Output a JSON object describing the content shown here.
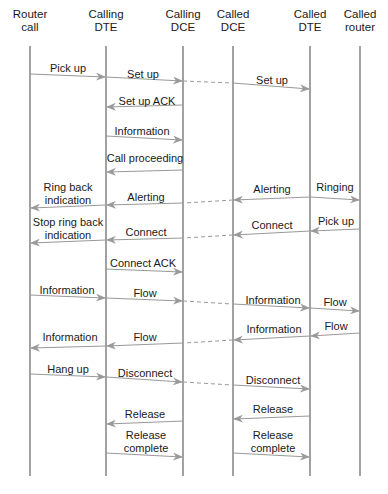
{
  "diagram": {
    "type": "sequence",
    "lifelines": [
      {
        "id": "router_call",
        "label": "Router\ncall",
        "line1": "Router",
        "line2": "call",
        "x": 30
      },
      {
        "id": "calling_dte",
        "label": "Calling\nDTE",
        "line1": "Calling",
        "line2": "DTE",
        "x": 106
      },
      {
        "id": "calling_dce",
        "label": "Calling\nDCE",
        "line1": "Calling",
        "line2": "DCE",
        "x": 183
      },
      {
        "id": "called_dce",
        "label": "Called\nDCE",
        "line1": "Called",
        "line2": "DCE",
        "x": 233
      },
      {
        "id": "called_dte",
        "label": "Called\nDTE",
        "line1": "Called",
        "line2": "DTE",
        "x": 310
      },
      {
        "id": "called_router",
        "label": "Called\nrouter",
        "line1": "Called",
        "line2": "router",
        "x": 360
      }
    ],
    "lifeline_top": 46,
    "lifeline_bottom": 476,
    "colors": {
      "line": "#555555",
      "arrow": "#999999",
      "text": "#1a1a1a"
    },
    "messages": [
      {
        "label": "Pick up",
        "from": 0,
        "to": 1,
        "y1": 74,
        "y2": 77,
        "lx": 68,
        "ly": 62
      },
      {
        "label": "Set up",
        "from": 1,
        "to": 2,
        "y1": 77,
        "y2": 81,
        "lx": 143,
        "ly": 68
      },
      {
        "label": "",
        "from": 2,
        "to": 3,
        "y1": 81,
        "y2": 83,
        "dashed": true
      },
      {
        "label": "Set up",
        "from": 3,
        "to": 4,
        "y1": 83,
        "y2": 89,
        "lx": 272,
        "ly": 74
      },
      {
        "label": "Set up ACK",
        "from": 2,
        "to": 1,
        "y1": 105,
        "y2": 107,
        "lx": 147,
        "ly": 95
      },
      {
        "label": "Information",
        "from": 1,
        "to": 2,
        "y1": 136,
        "y2": 140,
        "lx": 142,
        "ly": 125
      },
      {
        "label": "Call proceeding",
        "from": 2,
        "to": 1,
        "y1": 170,
        "y2": 172,
        "lx": 145,
        "ly": 152
      },
      {
        "label": "Ring back\nindication",
        "lines": [
          "Ring back",
          "indication"
        ],
        "from": 1,
        "to": 0,
        "y1": 205,
        "y2": 208,
        "lx": 68,
        "ly": 181
      },
      {
        "label": "Alerting",
        "from": 2,
        "to": 1,
        "y1": 203,
        "y2": 205,
        "lx": 146,
        "ly": 191
      },
      {
        "label": "",
        "from": 3,
        "to": 2,
        "y1": 200,
        "y2": 203,
        "dashed": true
      },
      {
        "label": "Alerting",
        "from": 4,
        "to": 3,
        "y1": 197,
        "y2": 200,
        "lx": 272,
        "ly": 183
      },
      {
        "label": "Ringing",
        "from": 4,
        "to": 5,
        "y1": 197,
        "y2": 200,
        "lx": 335,
        "ly": 181
      },
      {
        "label": "Stop ring back\nindication",
        "lines": [
          "Stop ring back",
          "indication"
        ],
        "from": 1,
        "to": 0,
        "y1": 240,
        "y2": 243,
        "lx": 68,
        "ly": 216
      },
      {
        "label": "Connect",
        "from": 2,
        "to": 1,
        "y1": 238,
        "y2": 240,
        "lx": 146,
        "ly": 226
      },
      {
        "label": "",
        "from": 3,
        "to": 2,
        "y1": 235,
        "y2": 238,
        "dashed": true
      },
      {
        "label": "Connect",
        "from": 4,
        "to": 3,
        "y1": 231,
        "y2": 235,
        "lx": 272,
        "ly": 219
      },
      {
        "label": "Pick up",
        "from": 5,
        "to": 4,
        "y1": 229,
        "y2": 231,
        "lx": 336,
        "ly": 215
      },
      {
        "label": "Connect ACK",
        "from": 1,
        "to": 2,
        "y1": 269,
        "y2": 272,
        "lx": 143,
        "ly": 257
      },
      {
        "label": "Information",
        "from": 0,
        "to": 1,
        "y1": 295,
        "y2": 298,
        "lx": 67,
        "ly": 284
      },
      {
        "label": "Flow",
        "from": 1,
        "to": 2,
        "y1": 298,
        "y2": 301,
        "lx": 145,
        "ly": 287
      },
      {
        "label": "",
        "from": 2,
        "to": 3,
        "y1": 301,
        "y2": 304,
        "dashed": true
      },
      {
        "label": "Information",
        "from": 3,
        "to": 4,
        "y1": 304,
        "y2": 308,
        "lx": 273,
        "ly": 294
      },
      {
        "label": "Flow",
        "from": 4,
        "to": 5,
        "y1": 308,
        "y2": 311,
        "lx": 335,
        "ly": 296
      },
      {
        "label": "Information",
        "from": 1,
        "to": 0,
        "y1": 346,
        "y2": 348,
        "lx": 70,
        "ly": 331
      },
      {
        "label": "Flow",
        "from": 2,
        "to": 1,
        "y1": 343,
        "y2": 346,
        "lx": 145,
        "ly": 331
      },
      {
        "label": "",
        "from": 3,
        "to": 2,
        "y1": 340,
        "y2": 343,
        "dashed": true
      },
      {
        "label": "Information",
        "from": 4,
        "to": 3,
        "y1": 336,
        "y2": 340,
        "lx": 274,
        "ly": 323
      },
      {
        "label": "Flow",
        "from": 5,
        "to": 4,
        "y1": 333,
        "y2": 336,
        "lx": 336,
        "ly": 320
      },
      {
        "label": "Hang up",
        "from": 0,
        "to": 1,
        "y1": 374,
        "y2": 377,
        "lx": 68,
        "ly": 363
      },
      {
        "label": "Disconnect",
        "from": 1,
        "to": 2,
        "y1": 377,
        "y2": 382,
        "lx": 145,
        "ly": 367
      },
      {
        "label": "",
        "from": 2,
        "to": 3,
        "y1": 382,
        "y2": 385,
        "dashed": true
      },
      {
        "label": "Disconnect",
        "from": 3,
        "to": 4,
        "y1": 385,
        "y2": 389,
        "lx": 273,
        "ly": 374
      },
      {
        "label": "Release",
        "from": 2,
        "to": 1,
        "y1": 421,
        "y2": 424,
        "lx": 145,
        "ly": 408
      },
      {
        "label": "Release",
        "from": 4,
        "to": 3,
        "y1": 416,
        "y2": 419,
        "lx": 273,
        "ly": 403
      },
      {
        "label": "Release\ncomplete",
        "lines": [
          "Release",
          "complete"
        ],
        "from": 1,
        "to": 2,
        "y1": 453,
        "y2": 457,
        "lx": 146,
        "ly": 429
      },
      {
        "label": "Release\ncomplete",
        "lines": [
          "Release",
          "complete"
        ],
        "from": 3,
        "to": 4,
        "y1": 453,
        "y2": 457,
        "lx": 273,
        "ly": 429
      }
    ]
  }
}
